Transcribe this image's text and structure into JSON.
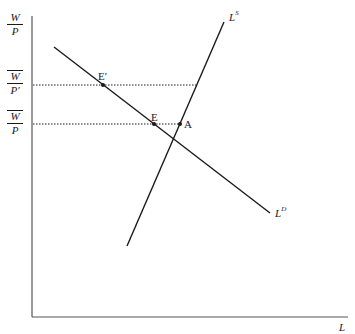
{
  "diagram": {
    "type": "labor-market supply-demand",
    "axes": {
      "y_label": {
        "num": "W",
        "den": "P"
      },
      "x_label": "L"
    },
    "wage_levels": [
      {
        "name": "high-real-wage",
        "num": "W",
        "den": "P′",
        "overline": true
      },
      {
        "name": "equilibrium-real-wage",
        "num": "W",
        "den": "P",
        "overline": true
      }
    ],
    "curves": [
      {
        "name": "labor-supply",
        "label": "L",
        "sup": "S"
      },
      {
        "name": "labor-demand",
        "label": "L",
        "sup": "D"
      }
    ],
    "points": [
      {
        "name": "E-prime",
        "label": "E′"
      },
      {
        "name": "E",
        "label": "E"
      },
      {
        "name": "A",
        "label": "A"
      }
    ],
    "colors": {
      "line": "#1a1a1a",
      "axis": "#555555"
    }
  }
}
